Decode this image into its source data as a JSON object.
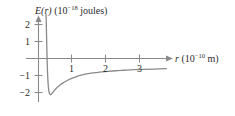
{
  "chart_data": {
    "type": "line",
    "title": "",
    "ylabel_html": "E(r) (10⁻¹⁸ joules)",
    "ylabel_parts": {
      "variable": "E",
      "argument": "(r)",
      "unit_prefix": "(10",
      "unit_exponent": "−18",
      "unit_suffix": " joules)"
    },
    "xlabel_html": "r (10⁻¹⁰ m)",
    "xlabel_parts": {
      "variable": "r",
      "unit_prefix": "(10",
      "unit_exponent": "−10",
      "unit_suffix": " m)"
    },
    "xticks": [
      1,
      2,
      3
    ],
    "xtick_labels": [
      "1",
      "2",
      "3"
    ],
    "yticks": [
      2,
      1,
      -1,
      -2
    ],
    "ytick_labels": [
      "2",
      "1",
      "−1",
      "−2"
    ],
    "xlim": [
      0,
      3.9
    ],
    "ylim": [
      -2.6,
      2.6
    ],
    "grid": false,
    "legend": null,
    "axis_arrows": {
      "x": "right",
      "y": "up"
    },
    "series": [
      {
        "name": "potential energy E(r)",
        "color": "#8a8a8a",
        "x": [
          0.222,
          0.228,
          0.234,
          0.24,
          0.248,
          0.256,
          0.266,
          0.278,
          0.292,
          0.308,
          0.326,
          0.346,
          0.368,
          0.392,
          0.418,
          0.446,
          0.476,
          0.508,
          0.545,
          0.59,
          0.645,
          0.71,
          0.79,
          0.885,
          0.995,
          1.12,
          1.26,
          1.42,
          1.6,
          1.8,
          2.02,
          2.26,
          2.52,
          2.8,
          3.1,
          3.42,
          3.76
        ],
        "y": [
          2.6,
          2.15,
          1.6,
          1.05,
          0.38,
          -0.22,
          -0.82,
          -1.32,
          -1.7,
          -1.95,
          -2.08,
          -2.13,
          -2.12,
          -2.07,
          -2.0,
          -1.93,
          -1.86,
          -1.79,
          -1.71,
          -1.63,
          -1.54,
          -1.45,
          -1.35,
          -1.25,
          -1.15,
          -1.06,
          -0.98,
          -0.91,
          -0.85,
          -0.8,
          -0.76,
          -0.72,
          -0.69,
          -0.66,
          -0.64,
          -0.62,
          -0.6
        ]
      }
    ],
    "annotations": []
  },
  "style": {
    "axis_color": "#8a8a8a",
    "curve_color": "#8a8a8a",
    "text_color": "#2b2b2b",
    "background": "#ffffff"
  }
}
